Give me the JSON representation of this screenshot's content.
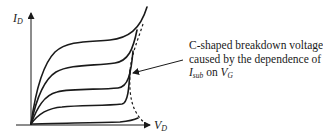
{
  "diagram": {
    "type": "MOSFET output characteristics (I_D vs V_D)",
    "y_axis": {
      "label": "I",
      "label_sub": "D"
    },
    "x_axis": {
      "label": "V",
      "label_sub": "D"
    },
    "curves": [
      {
        "name": "curve-1",
        "description": "highest V_G"
      },
      {
        "name": "curve-2"
      },
      {
        "name": "curve-3"
      },
      {
        "name": "curve-4"
      },
      {
        "name": "curve-5",
        "description": "lowest V_G"
      }
    ],
    "breakdown_locus": {
      "style": "dashed",
      "shape": "C-shaped"
    },
    "annotation": {
      "line1": "C-shaped breakdown voltage",
      "line2": "caused by the dependence of",
      "line3_var": "I",
      "line3_sub": "sub",
      "line3_mid": " on ",
      "line3_var2": "V",
      "line3_sub2": "G"
    },
    "colors": {
      "stroke": "#1a1a1a",
      "background": "#ffffff"
    }
  }
}
